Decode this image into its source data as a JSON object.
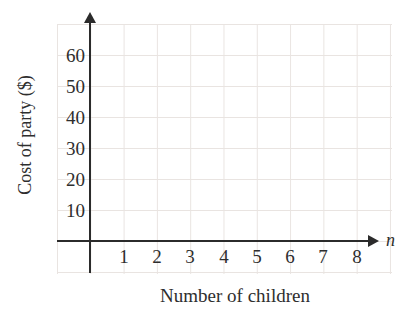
{
  "chart_data": {
    "type": "scatter",
    "title": "",
    "xlabel": "Number of children",
    "ylabel": "Cost of party ($)",
    "x_axis_symbol": "n",
    "x_ticks": [
      "1",
      "2",
      "3",
      "4",
      "5",
      "6",
      "7",
      "8"
    ],
    "y_ticks": [
      "10",
      "20",
      "30",
      "40",
      "50",
      "60"
    ],
    "xlim": [
      0,
      9
    ],
    "ylim": [
      0,
      70
    ],
    "grid": true,
    "legend": false,
    "series": [],
    "note": "empty coordinate grid with no plotted data points"
  },
  "colors": {
    "axis": "#2b2b2b",
    "text": "#2e2e2e",
    "gridline": "#e9e4e1",
    "background": "#ffffff"
  }
}
